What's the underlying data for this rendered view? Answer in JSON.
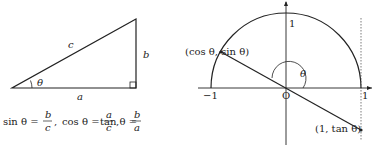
{
  "triangle": {
    "sides": {
      "hypotenuse": "c",
      "opposite": "b",
      "adjacent": "a"
    },
    "angle": "θ",
    "formulas": {
      "sin": {
        "lhs": "sin θ =",
        "num": "b",
        "den": "c"
      },
      "cos": {
        "lhs": "cos θ =",
        "num": "a",
        "den": "c"
      },
      "tan": {
        "lhs": "tan θ =",
        "num": "b",
        "den": "a"
      },
      "sep": ","
    }
  },
  "unit_circle": {
    "point_label": "(cos θ, sin θ)",
    "tan_label": "(1, tan θ)",
    "angle": "θ",
    "origin": "O",
    "ticks": {
      "neg_one": "−1",
      "pos_one": "1",
      "top_one": "1"
    }
  }
}
